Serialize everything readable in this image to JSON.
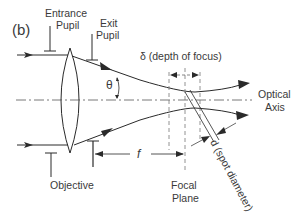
{
  "figure": {
    "panel_label": "(b)",
    "labels": {
      "entrance_pupil_line1": "Entrance",
      "entrance_pupil_line2": "Pupil",
      "exit_pupil_line1": "Exit",
      "exit_pupil_line2": "Pupil",
      "depth_of_focus": "δ (depth of focus)",
      "theta": "θ",
      "optical_axis_line1": "Optical",
      "optical_axis_line2": "Axis",
      "focal_length": "f",
      "spot_diameter": "d (spot diameter)",
      "objective": "Objective",
      "focal_plane_line1": "Focal",
      "focal_plane_line2": "Plane"
    },
    "colors": {
      "line": "#2a2a2a",
      "text": "#3a3a3a",
      "dashed": "#777777"
    }
  }
}
